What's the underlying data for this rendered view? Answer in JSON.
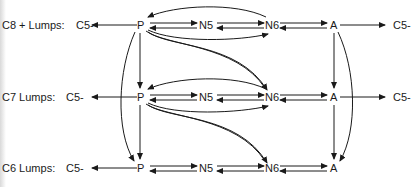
{
  "diagram": {
    "rows": [
      {
        "label": "C8 + Lumps:",
        "source": "C5-",
        "nodes": [
          "P",
          "N5",
          "N6",
          "A"
        ],
        "product": "C5-"
      },
      {
        "label": "C7 Lumps:",
        "source": "C5-",
        "nodes": [
          "P",
          "N5",
          "N6",
          "A"
        ],
        "product": "C5-"
      },
      {
        "label": "C6 Lumps:",
        "source": "C5-",
        "nodes": [
          "P",
          "N5",
          "N6",
          "A"
        ]
      }
    ],
    "edges": [
      {
        "from": "P",
        "to": "C5-",
        "rows": "all",
        "type": "single"
      },
      {
        "from": "P",
        "to": "N5",
        "type": "reversible"
      },
      {
        "from": "N5",
        "to": "N6",
        "type": "reversible"
      },
      {
        "from": "N6",
        "to": "A",
        "type": "reversible"
      },
      {
        "from": "P",
        "to": "N6",
        "type": "arc-reversible-same-row",
        "rows": [
          "C8+",
          "C7"
        ]
      },
      {
        "from": "A",
        "to": "C5-",
        "rows": [
          "C8+",
          "C7"
        ],
        "type": "single"
      },
      {
        "from": "P(C8+)",
        "to": "P(C7)",
        "type": "down"
      },
      {
        "from": "P(C7)",
        "to": "P(C6)",
        "type": "down"
      },
      {
        "from": "P(C8+)",
        "to": "P(C6)",
        "type": "arc"
      },
      {
        "from": "P(C8+)",
        "to": "N6(C7)",
        "type": "arc"
      },
      {
        "from": "P(C7)",
        "to": "N6(C6)",
        "type": "arc"
      },
      {
        "from": "A(C8+)",
        "to": "A(C7)",
        "type": "down"
      },
      {
        "from": "A(C7)",
        "to": "A(C6)",
        "type": "down"
      },
      {
        "from": "A(C8+)",
        "to": "A(C6)",
        "type": "arc"
      }
    ],
    "colors": {
      "ink": "#1a1a1a",
      "background": "#ffffff"
    }
  }
}
